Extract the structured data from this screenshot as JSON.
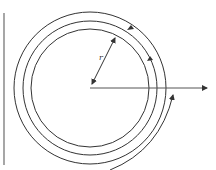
{
  "diagram": {
    "type": "spiral-path-with-radius",
    "center": {
      "x": 90,
      "y": 88
    },
    "radius_label": "r",
    "colors": {
      "stroke": "#333333",
      "wall": "#777777",
      "background": "#ffffff"
    },
    "elements": [
      {
        "name": "vertical-boundary-line"
      },
      {
        "name": "inner-circle"
      },
      {
        "name": "middle-loop"
      },
      {
        "name": "outer-loop"
      },
      {
        "name": "horizontal-axis-arrow"
      },
      {
        "name": "radius-double-arrow",
        "label": "r"
      }
    ]
  }
}
